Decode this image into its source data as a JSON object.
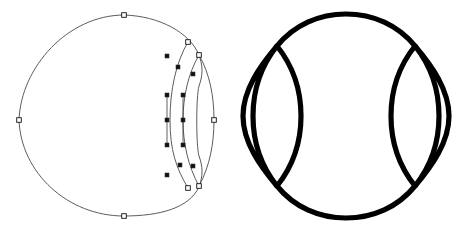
{
  "document": {
    "title": "Geometric Vector Figure",
    "background_color": "#ffffff",
    "width": 464,
    "height": 230
  },
  "figures": [
    {
      "id": "left-figure",
      "name": "editing-view",
      "description": "Circle with overlapping lens shape shown in path-edit mode with bezier anchors and handles",
      "stroke_color": "#4a4a4a",
      "stroke_width": 0.9,
      "fill": "none",
      "anchor_style": "hollow-square",
      "handle_style": "filled-square",
      "circle": {
        "center_x": 112,
        "center_y": 120,
        "radius_x": 93,
        "radius_y": 96
      },
      "paths": {
        "circle_arc": "M 124 15 C 160 16 190 33 199 55 C 203 66 203 75 199 86 C 196 96 196 146 199 156 C 203 167 203 176 199 187 C 189 208 160 216 124 216 C 68 216 21 173 19 120 C 21 67 68 15 124 15 Z",
        "crescent_edge": "M 188 42 C 176 62 170 90 170 120 C 170 150 176 168 188 188",
        "lens_left_edge": "M 199 55 C 188 74 183 97 183 120 C 183 143 188 166 199 186",
        "lens_right_edge": "M 199 55 C 210 74 214 97 214 120 C 214 143 210 166 199 186"
      },
      "anchor_points": [
        {
          "label": "top",
          "x": 124,
          "y": 15
        },
        {
          "label": "left",
          "x": 19,
          "y": 120
        },
        {
          "label": "bottom",
          "x": 124,
          "y": 216
        },
        {
          "label": "upper-intersection",
          "x": 188,
          "y": 42
        },
        {
          "label": "lens-top",
          "x": 199,
          "y": 55
        },
        {
          "label": "lens-right",
          "x": 214,
          "y": 120
        },
        {
          "label": "lens-bottom",
          "x": 199,
          "y": 186
        },
        {
          "label": "lower-intersection",
          "x": 188,
          "y": 188
        }
      ],
      "handle_points": [
        {
          "x": 167,
          "y": 56
        },
        {
          "x": 178,
          "y": 67
        },
        {
          "x": 193,
          "y": 74
        },
        {
          "x": 167,
          "y": 95
        },
        {
          "x": 167,
          "y": 145
        },
        {
          "x": 167,
          "y": 120
        },
        {
          "x": 183,
          "y": 95
        },
        {
          "x": 183,
          "y": 120
        },
        {
          "x": 183,
          "y": 145
        },
        {
          "x": 180,
          "y": 165
        },
        {
          "x": 193,
          "y": 166
        },
        {
          "x": 167,
          "y": 175
        }
      ],
      "handle_segments": [
        {
          "x1": 167,
          "y1": 95,
          "x2": 167,
          "y2": 145
        },
        {
          "x1": 183,
          "y1": 95,
          "x2": 183,
          "y2": 145
        }
      ]
    },
    {
      "id": "right-figure",
      "name": "outline-view",
      "description": "Finished thick black outline of circle flanked by two vesica lens shapes",
      "stroke_color": "#000000",
      "stroke_width": 5.2,
      "fill": "none",
      "circle": {
        "center_x": 346,
        "center_y": 116,
        "radius_x": 103,
        "radius_y": 102
      },
      "paths": {
        "main_body": "M 277 46 C 294 25 319 14 346 14 C 373 14 398 25 415 46 C 399 66 391 90 391 116 C 391 142 399 166 415 186 C 398 207 373 218 346 218 C 319 218 294 207 277 186 C 293 166 301 142 301 116 C 301 90 293 66 277 46 Z",
        "left_lens": "M 277 46 C 260 66 243 90 243 116 C 243 142 260 166 277 186 C 261 166 253 142 253 116 C 253 90 261 66 277 46 Z",
        "right_lens": "M 415 46 C 432 66 449 90 449 116 C 449 142 432 166 415 186 C 431 166 439 142 439 116 C 439 90 431 66 415 46 Z"
      },
      "junction_points": [
        {
          "label": "upper-left",
          "x": 277,
          "y": 46
        },
        {
          "label": "upper-right",
          "x": 415,
          "y": 46
        },
        {
          "label": "lower-left",
          "x": 277,
          "y": 186
        },
        {
          "label": "lower-right",
          "x": 415,
          "y": 186
        }
      ]
    }
  ],
  "colors": {
    "canvas": "#ffffff",
    "edit_stroke": "#4a4a4a",
    "outline_stroke": "#000000",
    "anchor_fill": "#ffffff",
    "handle_fill": "#111111"
  }
}
